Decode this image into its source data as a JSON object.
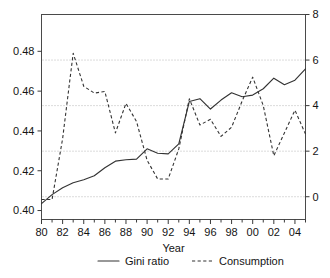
{
  "chart_data": {
    "type": "line",
    "title": "",
    "xlabel": "Year",
    "ylabel": "",
    "grid": true,
    "legend_position": "bottom",
    "x": [
      1980,
      1981,
      1982,
      1983,
      1984,
      1985,
      1986,
      1987,
      1988,
      1989,
      1990,
      1991,
      1992,
      1993,
      1994,
      1995,
      1996,
      1997,
      1998,
      1999,
      2000,
      2001,
      2002,
      2003,
      2004,
      2005
    ],
    "xtick_labels": [
      "80",
      "82",
      "84",
      "86",
      "88",
      "90",
      "92",
      "94",
      "96",
      "98",
      "00",
      "02",
      "04"
    ],
    "xtick_values": [
      1980,
      1982,
      1984,
      1986,
      1988,
      1990,
      1992,
      1994,
      1996,
      1998,
      2000,
      2002,
      2004
    ],
    "xlim": [
      1980,
      2005
    ],
    "left_axis": {
      "label": "",
      "ylim": [
        0.3955,
        0.4985
      ],
      "tick_labels": [
        "0.40",
        "0.42",
        "0.44",
        "0.46",
        "0.48"
      ],
      "tick_values": [
        0.4,
        0.42,
        0.44,
        0.46,
        0.48
      ]
    },
    "right_axis": {
      "label": "",
      "ylim": [
        -1.0,
        8.0
      ],
      "tick_labels": [
        "0",
        "2",
        "4",
        "6",
        "8"
      ],
      "tick_values": [
        0,
        2,
        4,
        6,
        8
      ]
    },
    "series": [
      {
        "name": "Gini ratio",
        "axis": "left",
        "style": "solid",
        "color": "#333333",
        "values": [
          0.4035,
          0.408,
          0.4115,
          0.414,
          0.4155,
          0.4175,
          0.4215,
          0.4248,
          0.4255,
          0.4258,
          0.431,
          0.4288,
          0.4285,
          0.4335,
          0.4548,
          0.4562,
          0.451,
          0.4555,
          0.4592,
          0.4572,
          0.458,
          0.4612,
          0.4665,
          0.4632,
          0.4655,
          0.4712
        ]
      },
      {
        "name": "Consumption",
        "axis": "right",
        "style": "dashed",
        "color": "#333333",
        "values": [
          -0.12,
          -0.12,
          2.55,
          6.3,
          4.85,
          4.55,
          4.62,
          2.8,
          4.1,
          3.3,
          1.6,
          0.78,
          0.78,
          2.1,
          4.3,
          3.15,
          3.4,
          2.65,
          3.05,
          4.2,
          5.25,
          4.0,
          1.8,
          2.8,
          3.8,
          2.75
        ]
      }
    ]
  },
  "legend": {
    "items": [
      {
        "label": "Gini ratio",
        "style": "solid"
      },
      {
        "label": "Consumption",
        "style": "dashed"
      }
    ]
  }
}
